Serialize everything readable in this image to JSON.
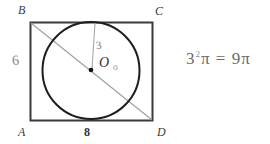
{
  "figure": {
    "shape": "rectangle-with-inscribed-circle",
    "vertices": {
      "top_left": "B",
      "top_right": "C",
      "bottom_left": "A",
      "bottom_right": "D"
    },
    "center_label": "O",
    "center_mark": "o",
    "dimensions": {
      "left_side": "6",
      "bottom_side": "8",
      "radius": "3"
    }
  },
  "work": {
    "base": "3",
    "exponent": "2",
    "pi_symbol": "π",
    "equals": "=",
    "result": "9π",
    "full": "3²π = 9π"
  },
  "colors": {
    "background": "#ffffff",
    "rect_stroke": "#3a3a3a",
    "circle_stroke": "#1d1d1d",
    "diagonal_stroke": "#9a9a9a",
    "radius_stroke": "#a0a0a0",
    "center_dot": "#111111",
    "handwriting": "#6f6f6f"
  }
}
